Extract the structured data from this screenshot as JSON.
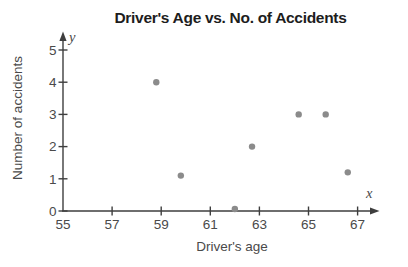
{
  "figure": {
    "title": "Driver's Age vs. No. of Accidents",
    "ylabel": "Number of accidents",
    "xlabel": "Driver's age",
    "y_axis_letter": "y",
    "x_axis_letter": "x"
  },
  "chart_data": {
    "type": "scatter",
    "title": "Driver's Age vs. No. of Accidents",
    "xlabel": "Driver's age",
    "ylabel": "Number of accidents",
    "points": [
      {
        "x": 58.8,
        "y": 4.0
      },
      {
        "x": 59.8,
        "y": 1.1
      },
      {
        "x": 62.0,
        "y": 0.0
      },
      {
        "x": 62.7,
        "y": 2.0
      },
      {
        "x": 64.6,
        "y": 3.0
      },
      {
        "x": 65.7,
        "y": 3.0
      },
      {
        "x": 66.6,
        "y": 1.2
      }
    ],
    "x_ticks": [
      55,
      57,
      59,
      61,
      63,
      65,
      67
    ],
    "y_ticks": [
      0,
      1,
      2,
      3,
      4,
      5
    ],
    "xlim": [
      55,
      68.2
    ],
    "ylim": [
      0,
      5.6
    ],
    "grid": false,
    "legend": null,
    "colors": {
      "point": "#8b8b8b",
      "axis": "#3e3e3e",
      "tick_text": "#4a4a4a",
      "title_text": "#1d1d1d"
    }
  }
}
